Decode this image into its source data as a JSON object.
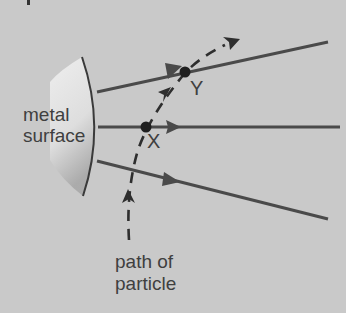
{
  "diagram": {
    "surface_label_line1": "metal",
    "surface_label_line2": "surface",
    "point_x_label": "X",
    "point_y_label": "Y",
    "path_label_line1": "path of",
    "path_label_line2": "particle",
    "colors": {
      "background": "#c9c9c9",
      "line": "#4a4a4a",
      "text": "#3f3f3f"
    }
  }
}
